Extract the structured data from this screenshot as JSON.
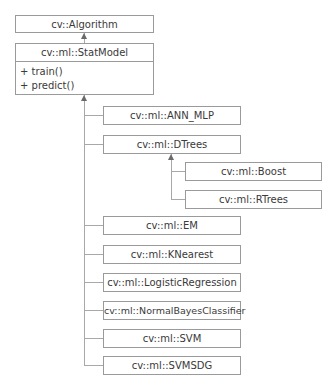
{
  "diagram": {
    "type": "uml-class-hierarchy",
    "root": {
      "name": "cv::Algorithm"
    },
    "base": {
      "name": "cv::ml::StatModel",
      "members": [
        "+ train()",
        "+ predict()"
      ]
    },
    "children": [
      {
        "name": "cv::ml::ANN_MLP"
      },
      {
        "name": "cv::ml::DTrees",
        "children": [
          {
            "name": "cv::ml::Boost"
          },
          {
            "name": "cv::ml::RTrees"
          }
        ]
      },
      {
        "name": "cv::ml::EM"
      },
      {
        "name": "cv::ml::KNearest"
      },
      {
        "name": "cv::ml::LogisticRegression"
      },
      {
        "name": "cv::ml::NormalBayesClassifier"
      },
      {
        "name": "cv::ml::SVM"
      },
      {
        "name": "cv::ml::SVMSDG"
      }
    ],
    "colors": {
      "border": "#9a9a9a",
      "line": "#a8a8a8",
      "arrow": "#6a6a6a",
      "text": "#3a3a3a",
      "background": "#ffffff"
    }
  }
}
